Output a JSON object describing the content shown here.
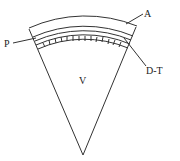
{
  "diagram": {
    "labels": {
      "A": "A",
      "P": "P",
      "DT": "D-T",
      "V": "V"
    },
    "colors": {
      "stroke": "#333333",
      "background": "#ffffff"
    }
  }
}
